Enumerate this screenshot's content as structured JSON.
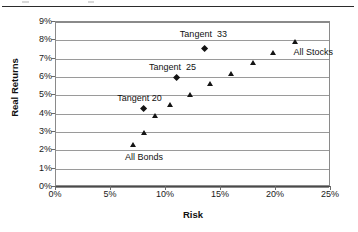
{
  "chart_data": {
    "type": "scatter",
    "title": "",
    "xlabel": "Risk",
    "ylabel": "Real Returns",
    "xlim": [
      0,
      25
    ],
    "ylim": [
      0,
      9
    ],
    "xticks": [
      "0%",
      "5%",
      "10%",
      "15%",
      "20%",
      "25%"
    ],
    "yticks": [
      "0%",
      "1%",
      "2%",
      "3%",
      "4%",
      "5%",
      "6%",
      "7%",
      "8%",
      "9%"
    ],
    "xtick_values": [
      0,
      5,
      10,
      15,
      20,
      25
    ],
    "ytick_values": [
      0,
      1,
      2,
      3,
      4,
      5,
      6,
      7,
      8,
      9
    ],
    "grid": "horizontal",
    "legend": "none",
    "marker_color": "#141414",
    "series": [
      {
        "name": "Efficient Frontier Portfolios",
        "marker": "triangle",
        "points": [
          {
            "x": 7.0,
            "y": 2.3
          },
          {
            "x": 8.0,
            "y": 2.95
          },
          {
            "x": 9.0,
            "y": 3.9
          },
          {
            "x": 10.4,
            "y": 4.5
          },
          {
            "x": 12.2,
            "y": 5.0
          },
          {
            "x": 14.0,
            "y": 5.6
          },
          {
            "x": 15.9,
            "y": 6.15
          },
          {
            "x": 17.9,
            "y": 6.75
          },
          {
            "x": 19.8,
            "y": 7.3
          },
          {
            "x": 21.8,
            "y": 7.9
          }
        ]
      },
      {
        "name": "Tangent Portfolios",
        "marker": "diamond",
        "points": [
          {
            "x": 8.0,
            "y": 4.25,
            "label": "Tangent 20"
          },
          {
            "x": 11.0,
            "y": 5.95,
            "label": "Tangent  25"
          },
          {
            "x": 13.5,
            "y": 7.55,
            "label": "Tangent  33"
          }
        ]
      }
    ],
    "annotations": [
      {
        "text": "Tangent  33",
        "x": 13.4,
        "y": 8.35
      },
      {
        "text": "Tangent  25",
        "x": 10.6,
        "y": 6.55
      },
      {
        "text": "Tangent 20",
        "x": 7.6,
        "y": 4.85
      },
      {
        "text": "All Bonds",
        "x": 8.0,
        "y": 1.65
      },
      {
        "text": "All Stocks",
        "x": 21.6,
        "y": 7.35
      }
    ]
  },
  "axes": {
    "y_title": "Real Returns",
    "x_title": "Risk",
    "y_tick_labels": [
      "9%",
      "8%",
      "7%",
      "6%",
      "5%",
      "4%",
      "3%",
      "2%",
      "1%",
      "0%"
    ],
    "x_tick_labels": [
      "0%",
      "5%",
      "10%",
      "15%",
      "20%",
      "25%"
    ]
  },
  "labels": {
    "tangent_33": "Tangent  33",
    "tangent_25": "Tangent  25",
    "tangent_20": "Tangent 20",
    "all_bonds": "All Bonds",
    "all_stocks": "All Stocks"
  }
}
